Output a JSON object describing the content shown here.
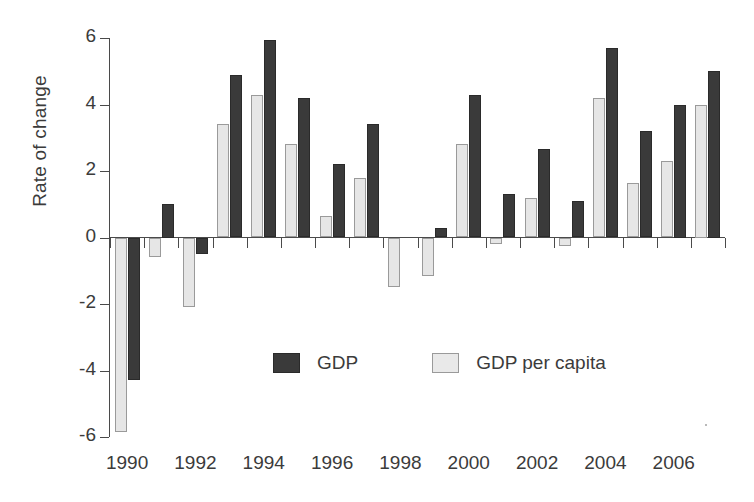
{
  "chart_data": {
    "type": "bar",
    "title": "",
    "subtitle": "",
    "xlabel": "",
    "ylabel": "Rate of change",
    "ylim": [
      -6,
      6
    ],
    "yticks": [
      6,
      4,
      2,
      0,
      -2,
      -4,
      -6
    ],
    "ytick_labels": [
      "6",
      "4",
      "2",
      "0",
      "-2",
      "-4",
      "-6"
    ],
    "grid": false,
    "legend_position": "inside-bottom-center",
    "categories": [
      "1990",
      "1991",
      "1992",
      "1993",
      "1994",
      "1995",
      "1996",
      "1997",
      "1998",
      "1999",
      "2000",
      "2001",
      "2002",
      "2003",
      "2004",
      "2005",
      "2006",
      "2007"
    ],
    "xtick_labels": [
      "1990",
      "1992",
      "1994",
      "1996",
      "1998",
      "2000",
      "2002",
      "2004",
      "2006"
    ],
    "xtick_categories": [
      "1990",
      "1992",
      "1994",
      "1996",
      "1998",
      "2000",
      "2002",
      "2004",
      "2006"
    ],
    "series": [
      {
        "name": "GDP",
        "color": "#3a3a3a",
        "values": [
          -4.3,
          1.0,
          -0.5,
          4.9,
          5.95,
          4.2,
          2.2,
          3.4,
          0.0,
          0.3,
          4.3,
          1.3,
          2.65,
          1.1,
          5.7,
          3.2,
          4.0,
          5.0
        ]
      },
      {
        "name": "GDP per capita",
        "color": "#e6e6e6",
        "values": [
          -5.85,
          -0.6,
          -2.1,
          3.4,
          4.3,
          2.8,
          0.65,
          1.8,
          -1.5,
          -1.15,
          2.8,
          -0.2,
          1.2,
          -0.25,
          4.2,
          1.65,
          2.3,
          4.0
        ]
      }
    ]
  },
  "legend": {
    "items": [
      {
        "label": "GDP",
        "swatch": "dark-swatch"
      },
      {
        "label": "GDP per capita",
        "swatch": "light-swatch"
      }
    ]
  },
  "axis": {
    "y_title": "Rate of change"
  }
}
